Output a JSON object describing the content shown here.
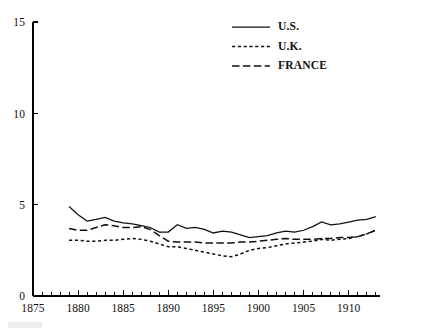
{
  "chart_data": {
    "type": "line",
    "title": "",
    "subtitle": "",
    "xlabel": "",
    "ylabel": "",
    "xlim": [
      1875,
      1913.5
    ],
    "ylim": [
      0,
      15
    ],
    "grid": false,
    "legend_position": "top-center",
    "y_ticks": [
      0,
      5,
      10,
      15
    ],
    "y_tick_labels": [
      "0",
      "5",
      "10",
      "15"
    ],
    "x_ticks": [
      1875,
      1880,
      1885,
      1890,
      1895,
      1900,
      1905,
      1910
    ],
    "x_tick_labels": [
      "1875",
      "1880",
      "1885",
      "1890",
      "1895",
      "1900",
      "1905",
      "1910"
    ],
    "x_minor_tick_step": 1,
    "x": [
      1879,
      1880,
      1881,
      1882,
      1883,
      1884,
      1885,
      1886,
      1887,
      1888,
      1889,
      1890,
      1891,
      1892,
      1893,
      1894,
      1895,
      1896,
      1897,
      1898,
      1899,
      1900,
      1901,
      1902,
      1903,
      1904,
      1905,
      1906,
      1907,
      1908,
      1909,
      1910,
      1911,
      1912,
      1913
    ],
    "series": [
      {
        "name": "U.S.",
        "style": "solid",
        "color": "#111111",
        "values": [
          4.9,
          4.45,
          4.1,
          4.2,
          4.3,
          4.1,
          4.0,
          3.95,
          3.85,
          3.75,
          3.5,
          3.5,
          3.9,
          3.7,
          3.75,
          3.65,
          3.45,
          3.55,
          3.5,
          3.35,
          3.2,
          3.25,
          3.3,
          3.45,
          3.55,
          3.5,
          3.6,
          3.8,
          4.05,
          3.9,
          3.95,
          4.05,
          4.15,
          4.2,
          4.35
        ]
      },
      {
        "name": "U.K.",
        "style": "dotted",
        "color": "#111111",
        "values": [
          3.05,
          3.05,
          3.0,
          3.0,
          3.05,
          3.05,
          3.1,
          3.15,
          3.1,
          3.0,
          2.85,
          2.7,
          2.7,
          2.6,
          2.5,
          2.4,
          2.3,
          2.2,
          2.15,
          2.3,
          2.5,
          2.6,
          2.65,
          2.75,
          2.85,
          2.9,
          2.95,
          3.0,
          3.1,
          3.05,
          3.1,
          3.15,
          3.25,
          3.4,
          3.6
        ]
      },
      {
        "name": "FRANCE",
        "style": "dashed",
        "color": "#111111",
        "values": [
          3.7,
          3.6,
          3.6,
          3.75,
          3.9,
          3.85,
          3.75,
          3.75,
          3.8,
          3.65,
          3.3,
          3.0,
          2.95,
          2.95,
          2.95,
          2.9,
          2.9,
          2.9,
          2.9,
          2.95,
          2.95,
          3.0,
          3.05,
          3.1,
          3.15,
          3.1,
          3.1,
          3.1,
          3.15,
          3.15,
          3.2,
          3.2,
          3.25,
          3.4,
          3.6
        ]
      }
    ]
  },
  "legend": {
    "entries": [
      {
        "label": "U.S.",
        "style": "solid"
      },
      {
        "label": "U.K.",
        "style": "dotted"
      },
      {
        "label": "FRANCE",
        "style": "dashed"
      }
    ]
  }
}
